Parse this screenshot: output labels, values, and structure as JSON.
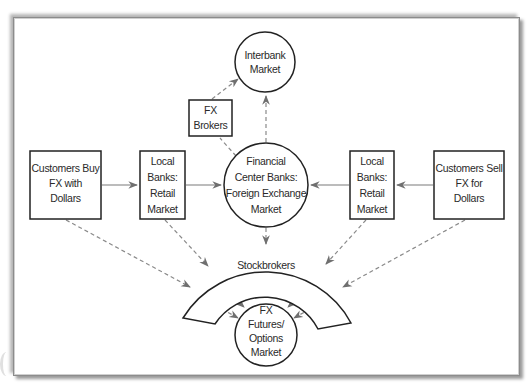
{
  "diagram": {
    "nodes": {
      "interbank": {
        "lines": [
          "Interbank",
          "Market"
        ],
        "shape": "circle"
      },
      "fx_brokers": {
        "lines": [
          "FX",
          "Brokers"
        ],
        "shape": "box"
      },
      "financial_center": {
        "lines": [
          "Financial",
          "Center Banks:",
          "Foreign Exchange",
          "Market"
        ],
        "shape": "circle"
      },
      "customers_buy": {
        "lines": [
          "Customers Buy",
          "FX with",
          "Dollars"
        ],
        "shape": "box"
      },
      "local_banks_left": {
        "lines": [
          "Local",
          "Banks:",
          "Retail",
          "Market"
        ],
        "shape": "box"
      },
      "local_banks_right": {
        "lines": [
          "Local",
          "Banks:",
          "Retail",
          "Market"
        ],
        "shape": "box"
      },
      "customers_sell": {
        "lines": [
          "Customers Sell",
          "FX for",
          "Dollars"
        ],
        "shape": "box"
      },
      "stockbrokers": {
        "lines": [
          "Stockbrokers"
        ],
        "shape": "arch"
      },
      "fx_futures": {
        "lines": [
          "FX",
          "Futures/",
          "Options",
          "Market"
        ],
        "shape": "circle"
      }
    },
    "edges": [
      {
        "from": "customers_buy",
        "to": "local_banks_left",
        "style": "solid"
      },
      {
        "from": "local_banks_left",
        "to": "financial_center",
        "style": "solid"
      },
      {
        "from": "customers_sell",
        "to": "local_banks_right",
        "style": "solid"
      },
      {
        "from": "local_banks_right",
        "to": "financial_center",
        "style": "solid"
      },
      {
        "from": "financial_center",
        "to": "interbank",
        "style": "dashed"
      },
      {
        "from": "fx_brokers",
        "to": "interbank",
        "style": "dashed"
      },
      {
        "from": "financial_center",
        "to": "fx_brokers",
        "style": "dashed"
      },
      {
        "from": "financial_center",
        "to": "stockbrokers",
        "style": "dashed"
      },
      {
        "from": "customers_buy",
        "to": "stockbrokers",
        "style": "dashed"
      },
      {
        "from": "local_banks_left",
        "to": "stockbrokers",
        "style": "dashed"
      },
      {
        "from": "local_banks_right",
        "to": "stockbrokers",
        "style": "dashed"
      },
      {
        "from": "customers_sell",
        "to": "stockbrokers",
        "style": "dashed"
      },
      {
        "from": "stockbrokers",
        "to": "fx_futures",
        "style": "dashed"
      }
    ],
    "colors": {
      "outline": "#222222",
      "arrow": "#7a7a7a",
      "frame_shadow": "#9a9a9a"
    }
  }
}
